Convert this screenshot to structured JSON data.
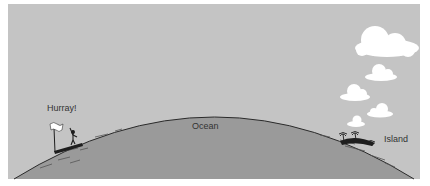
{
  "figure": {
    "labels": {
      "hurray": "Hurray!",
      "ocean": "Ocean",
      "island": "Island"
    },
    "colors": {
      "sky": "#c4c4c4",
      "ocean": "#9a9a9a",
      "outline": "#2a2a2a",
      "cloud": "#ffffff",
      "background": "#ffffff"
    },
    "elements": [
      "person-with-flag",
      "ocean-curve",
      "island-with-palm-trees",
      "clouds"
    ]
  }
}
